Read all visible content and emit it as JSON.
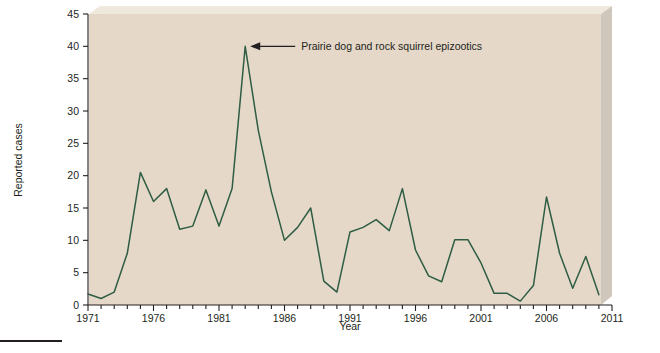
{
  "figure": {
    "background_color": "#ffffff",
    "plot_background_color": "#e5d8c8",
    "plot_bevel_top_color": "#efe9dd",
    "plot_bevel_right_color": "#cfc7bc",
    "line_color": "#2e5d44",
    "axis_color": "#231f20",
    "annotation_color": "#231f20",
    "caption_rule_color": "#231f20"
  },
  "chart_data": {
    "type": "line",
    "title": "",
    "xlabel": "Year",
    "ylabel": "Reported cases",
    "xlim": [
      1971,
      2011
    ],
    "ylim": [
      0,
      45
    ],
    "ytick_step": 5,
    "xtick_step": 1,
    "grid": false,
    "legend": "none",
    "y_ticks": [
      0,
      5,
      10,
      15,
      20,
      25,
      30,
      35,
      40,
      45
    ],
    "y_tick_labels": [
      "0",
      "5",
      "10",
      "15",
      "20",
      "25",
      "30",
      "35",
      "40",
      "45"
    ],
    "x_ticks": [
      1971,
      1976,
      1981,
      1986,
      1991,
      1996,
      2001,
      2006,
      2011
    ],
    "x_tick_labels": [
      "1971",
      "1976",
      "1981",
      "1986",
      "1991",
      "1996",
      "2001",
      "2006",
      "2011"
    ],
    "x": [
      1971,
      1972,
      1973,
      1974,
      1975,
      1976,
      1977,
      1978,
      1979,
      1980,
      1981,
      1982,
      1983,
      1984,
      1985,
      1986,
      1987,
      1988,
      1989,
      1990,
      1991,
      1992,
      1993,
      1994,
      1995,
      1996,
      1997,
      1998,
      1999,
      2000,
      2001,
      2002,
      2003,
      2004,
      2005,
      2006,
      2007,
      2008,
      2009,
      2010
    ],
    "values": [
      1.7,
      1,
      2,
      8,
      20.5,
      16,
      18,
      11.7,
      12.2,
      17.8,
      12.2,
      18,
      40,
      27,
      17.5,
      10,
      12,
      15,
      3.7,
      2,
      11.3,
      12,
      13.2,
      11.5,
      18,
      8.5,
      4.5,
      3.6,
      10.1,
      10.1,
      6.5,
      1.8,
      1.8,
      0.6,
      3,
      16.7,
      8,
      2.6,
      7.5,
      1.6
    ],
    "series": [
      {
        "name": "Reported cases",
        "values": [
          1.7,
          1,
          2,
          8,
          20.5,
          16,
          18,
          11.7,
          12.2,
          17.8,
          12.2,
          18,
          40,
          27,
          17.5,
          10,
          12,
          15,
          3.7,
          2,
          11.3,
          12,
          13.2,
          11.5,
          18,
          8.5,
          4.5,
          3.6,
          10.1,
          10.1,
          6.5,
          1.8,
          1.8,
          0.6,
          3,
          16.7,
          8,
          2.6,
          7.5,
          1.6
        ]
      }
    ],
    "annotations": [
      {
        "text": "Prairie dog and rock squirrel epizootics",
        "points_to_x": 1983,
        "points_to_y": 40,
        "arrow": "left"
      }
    ]
  }
}
